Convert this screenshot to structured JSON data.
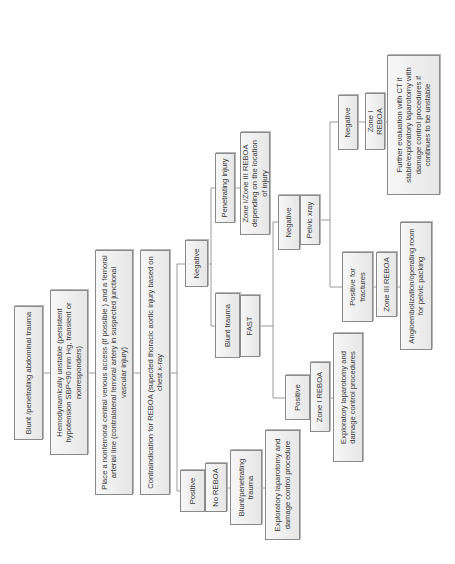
{
  "diagram": {
    "type": "flowchart",
    "orientation": "rotated-90-ccw",
    "nodes": {
      "start": "Blunt /penetrating abdominal trauma",
      "unstable": "Hemodynamically unstable (persistent hypotension SBP<90 mm Hg, transient or nonresponders)",
      "access": "Place a nonfemoral central venous access (if possible ) and a femoral arterial line (contralateral femoral artery in suspected junctional vascular injury)",
      "contraindication": "Contraindication for REBOA (supected thoracic aortic injury based on chest x-ray",
      "negative_main": "Negative",
      "positive_main": "Positive",
      "no_reboa": "No REBOA",
      "blunt_penetrating_trauma": "Blunt/penetrating trauma",
      "explap_left": "Exploratory laparotomy and damage control procedure",
      "blunt_trauma": "Blunt trauma",
      "fast": "FAST",
      "penetrating_injury": "Penetrating injury",
      "zone_i_iii": "Zone I/Zone III REBOA depending on the location of injury",
      "fast_positive": "Positive",
      "fast_zone1": "Zone I REBOA",
      "fast_explap": "Exploratory laparotomy and damage control procedures",
      "fast_negative": "Negative",
      "pelvic_xray": "Pelvic xray",
      "positive_fractures": "Positive for fractures",
      "zone3": "Zone III REBOA",
      "angio": "Angioembolization/operating room for pelvic packing",
      "pelvic_negative": "Negative",
      "pelvic_zone1": "Zone I REBOA",
      "further_eval": "Further evaluation with CT if stable/exploratory laparotomy with damage control procedures if continues to be unstable"
    }
  }
}
